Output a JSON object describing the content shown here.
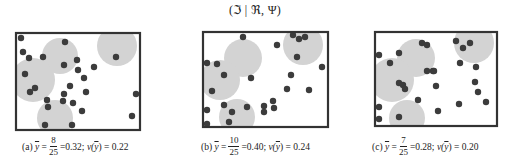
{
  "figure": {
    "title": "(ℑ | ℜ, Ψ)",
    "colors": {
      "frame": "#333333",
      "coverage": "#d3d3d3",
      "point": "#3c3c3c",
      "background": "#ffffff"
    }
  },
  "panels": [
    {
      "label": "(a)",
      "ybar_symbol": "y",
      "numerator": "8",
      "denominator": "25",
      "mean_value": "=0.32;",
      "var_label": "v(",
      "var_symbol": "y",
      "var_value": ") = 0.22",
      "caption_x": 22
    },
    {
      "label": "(b)",
      "ybar_symbol": "y",
      "numerator": "10",
      "denominator": "25",
      "mean_value": "=0.40;",
      "var_label": "v(",
      "var_symbol": "y",
      "var_value": ") = 0.24",
      "caption_x": 201
    },
    {
      "label": "(c)",
      "ybar_symbol": "y",
      "numerator": "7",
      "denominator": "25",
      "mean_value": "=0.28;",
      "var_label": "v(",
      "var_symbol": "y",
      "var_value": ") = 0.20",
      "caption_x": 372
    }
  ],
  "chart_data": [
    {
      "type": "scatter",
      "title": "(a)",
      "frame": [
        16,
        33,
        140,
        130
      ],
      "coverage_circles": [
        [
          117,
          46,
          20
        ],
        [
          60,
          56,
          18
        ],
        [
          33,
          80,
          22
        ],
        [
          55,
          118,
          18
        ]
      ],
      "points": [
        [
          21,
          38
        ],
        [
          65,
          42
        ],
        [
          23,
          52
        ],
        [
          29,
          58
        ],
        [
          43,
          57
        ],
        [
          64,
          65
        ],
        [
          77,
          60
        ],
        [
          78,
          70
        ],
        [
          94,
          67
        ],
        [
          116,
          57
        ],
        [
          25,
          74
        ],
        [
          84,
          78
        ],
        [
          70,
          86
        ],
        [
          86,
          92
        ],
        [
          35,
          88
        ],
        [
          30,
          92
        ],
        [
          64,
          94
        ],
        [
          63,
          101
        ],
        [
          47,
          100
        ],
        [
          48,
          107
        ],
        [
          73,
          103
        ],
        [
          82,
          111
        ],
        [
          136,
          94
        ],
        [
          132,
          116
        ],
        [
          45,
          125
        ],
        [
          72,
          125
        ]
      ],
      "summary": {
        "covered": 8,
        "total": 25,
        "mean": 0.32,
        "variance": 0.22
      }
    },
    {
      "type": "scatter",
      "title": "(b)",
      "frame": [
        203,
        32,
        328,
        127
      ],
      "coverage_circles": [
        [
          303,
          45,
          20
        ],
        [
          243,
          58,
          19
        ],
        [
          220,
          80,
          20
        ],
        [
          237,
          117,
          18
        ]
      ],
      "points": [
        [
          243,
          37
        ],
        [
          293,
          35
        ],
        [
          299,
          39
        ],
        [
          305,
          37
        ],
        [
          277,
          45
        ],
        [
          297,
          57
        ],
        [
          207,
          63
        ],
        [
          217,
          64
        ],
        [
          224,
          75
        ],
        [
          251,
          78
        ],
        [
          322,
          67
        ],
        [
          291,
          75
        ],
        [
          212,
          91
        ],
        [
          287,
          89
        ],
        [
          309,
          90
        ],
        [
          273,
          101
        ],
        [
          264,
          106
        ],
        [
          274,
          108
        ],
        [
          264,
          112
        ],
        [
          224,
          105
        ],
        [
          232,
          112
        ],
        [
          247,
          107
        ],
        [
          207,
          110
        ],
        [
          207,
          124
        ],
        [
          229,
          122
        ]
      ],
      "summary": {
        "covered": 10,
        "total": 25,
        "mean": 0.4,
        "variance": 0.24
      }
    },
    {
      "type": "scatter",
      "title": "(c)",
      "frame": [
        375,
        32,
        497,
        126
      ],
      "coverage_circles": [
        [
          474,
          43,
          20
        ],
        [
          416,
          58,
          19
        ],
        [
          392,
          80,
          22
        ],
        [
          407,
          118,
          18
        ]
      ],
      "points": [
        [
          422,
          43
        ],
        [
          427,
          45
        ],
        [
          399,
          53
        ],
        [
          379,
          55
        ],
        [
          390,
          63
        ],
        [
          427,
          71
        ],
        [
          433,
          71
        ],
        [
          399,
          83
        ],
        [
          403,
          85
        ],
        [
          405,
          89
        ],
        [
          418,
          100
        ],
        [
          379,
          107
        ],
        [
          379,
          119
        ],
        [
          399,
          117
        ],
        [
          456,
          41
        ],
        [
          470,
          43
        ],
        [
          463,
          48
        ],
        [
          460,
          63
        ],
        [
          476,
          67
        ],
        [
          434,
          71
        ],
        [
          475,
          82
        ],
        [
          436,
          86
        ],
        [
          478,
          92
        ],
        [
          486,
          102
        ],
        [
          459,
          104
        ],
        [
          438,
          111
        ]
      ],
      "summary": {
        "covered": 7,
        "total": 25,
        "mean": 0.28,
        "variance": 0.2
      }
    }
  ]
}
